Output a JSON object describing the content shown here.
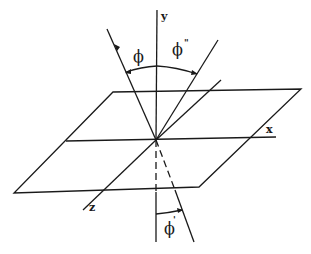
{
  "diagram": {
    "axes": {
      "x_label": "x",
      "y_label": "y",
      "z_label": "z"
    },
    "angles": {
      "incident": {
        "symbol": "ϕ",
        "superscript": ""
      },
      "reflected": {
        "symbol": "ϕ",
        "superscript": "\""
      },
      "refracted": {
        "symbol": "ϕ",
        "superscript": "'"
      }
    },
    "colors": {
      "line": "#1a1a1a",
      "background": "#ffffff"
    }
  }
}
